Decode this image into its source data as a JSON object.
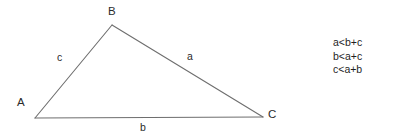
{
  "figure": {
    "kind": "geometry-diagram",
    "background_color": "#ffffff",
    "line_color": "#6e6e6e",
    "text_color": "#2b2b2b",
    "triangle": {
      "vertices": [
        {
          "name": "A",
          "label": "A",
          "x": 35,
          "y": 118
        },
        {
          "name": "B",
          "label": "B",
          "x": 112,
          "y": 25
        },
        {
          "name": "C",
          "label": "C",
          "x": 263,
          "y": 117
        }
      ],
      "sides": [
        {
          "name": "c",
          "label": "c",
          "from": "A",
          "to": "B"
        },
        {
          "name": "a",
          "label": "a",
          "from": "B",
          "to": "C"
        },
        {
          "name": "b",
          "label": "b",
          "from": "A",
          "to": "C"
        }
      ]
    },
    "inequalities": {
      "lines": [
        "a<b+c",
        "b<a+c",
        "c<a+b"
      ]
    }
  }
}
